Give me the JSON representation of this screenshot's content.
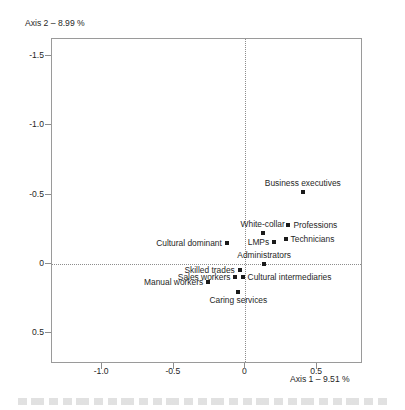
{
  "chart_data": {
    "type": "scatter",
    "title": "",
    "xlabel": "Axis 1 – 9.51 %",
    "ylabel": "Axis 2 – 8.99 %",
    "xlim": [
      -1.35,
      0.82
    ],
    "ylim": [
      -1.62,
      0.72
    ],
    "y_axis_inverted": true,
    "grid": false,
    "legend": "none",
    "zero_reference_lines": true,
    "xticks": [
      "-1.0",
      "-0.5",
      "0",
      "0.5"
    ],
    "xtick_values": [
      -1.0,
      -0.5,
      0,
      0.5
    ],
    "yticks": [
      "-1.5",
      "-1.0",
      "-0.5",
      "0",
      "0.5"
    ],
    "ytick_values": [
      -1.5,
      -1.0,
      -0.5,
      0,
      0.5
    ],
    "marker": "filled-square",
    "marker_color": "#1a1a1a",
    "points": [
      {
        "label": "Business executives",
        "x": 0.4,
        "y": -0.52,
        "label_pos": "above"
      },
      {
        "label": "Professions",
        "x": 0.3,
        "y": -0.28,
        "label_pos": "right"
      },
      {
        "label": "White-collar",
        "x": 0.12,
        "y": -0.22,
        "label_pos": "above"
      },
      {
        "label": "Technicians",
        "x": 0.28,
        "y": -0.18,
        "label_pos": "right"
      },
      {
        "label": "LMPs",
        "x": 0.2,
        "y": -0.16,
        "label_pos": "left"
      },
      {
        "label": "Cultural dominant",
        "x": -0.13,
        "y": -0.15,
        "label_pos": "left"
      },
      {
        "label": "Administrators",
        "x": 0.13,
        "y": 0.0,
        "label_pos": "above"
      },
      {
        "label": "Skilled trades",
        "x": -0.04,
        "y": 0.04,
        "label_pos": "left"
      },
      {
        "label": "Cultural intermediaries",
        "x": -0.02,
        "y": 0.09,
        "label_pos": "right"
      },
      {
        "label": "Sales workers",
        "x": -0.07,
        "y": 0.09,
        "label_pos": "left"
      },
      {
        "label": "Manual workers",
        "x": -0.26,
        "y": 0.13,
        "label_pos": "left"
      },
      {
        "label": "Caring services",
        "x": -0.05,
        "y": 0.2,
        "label_pos": "below"
      }
    ]
  },
  "axes": {
    "x_title": "Axis 1 – 9.51 %",
    "y_title": "Axis 2 – 8.99 %"
  }
}
